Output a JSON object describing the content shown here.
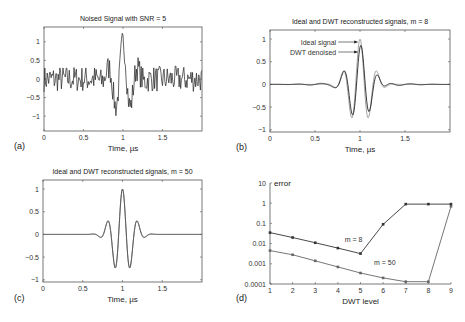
{
  "figure": {
    "panels": [
      "(a)",
      "(b)",
      "(c)",
      "(d)"
    ]
  },
  "chart_data": [
    {
      "id": "a",
      "panel_label": "(a)",
      "type": "line",
      "title": "Noised Signal with SNR = 5",
      "xlabel": "Time, µs",
      "ylabel": "",
      "xlim": [
        0,
        2
      ],
      "ylim": [
        -1.4,
        1.4
      ],
      "xticks": [
        0,
        0.5,
        1,
        1.5
      ],
      "xtick_labels": [
        "0",
        "0.5",
        "1",
        "1.5"
      ],
      "yticks": [
        1,
        0.5,
        0,
        -0.5,
        -1
      ],
      "ytick_labels": [
        "1",
        "0.5",
        "0",
        "−0.5",
        "−1"
      ],
      "series": [
        {
          "name": "noised signal",
          "kind": "noisy_wavelet",
          "center": 1.0,
          "amplitude": 1.0,
          "noise": 0.22,
          "color": "#222222"
        }
      ]
    },
    {
      "id": "b",
      "panel_label": "(b)",
      "type": "line",
      "title": "Ideal and DWT reconstructed signals, m = 8",
      "xlabel": "Time, µs",
      "ylabel": "",
      "xlim": [
        0,
        2
      ],
      "ylim": [
        -1.05,
        1.2
      ],
      "xticks": [
        0,
        0.5,
        1,
        1.5
      ],
      "xtick_labels": [
        "0",
        "0.5",
        "1",
        "1.5"
      ],
      "yticks": [
        1,
        0.5,
        0,
        -0.5,
        -1
      ],
      "ytick_labels": [
        "1",
        "0.5",
        "0",
        "−0.5",
        "−1"
      ],
      "series": [
        {
          "name": "Ideal signal",
          "kind": "wavelet",
          "center": 1.0,
          "amplitude": 1.0,
          "color": "#999999"
        },
        {
          "name": "DWT denoised",
          "kind": "wavelet_distorted",
          "center": 1.0,
          "amplitude": 0.85,
          "color": "#222222"
        }
      ],
      "annotations": [
        "Ideal signal",
        "DWT denoised"
      ]
    },
    {
      "id": "c",
      "panel_label": "(c)",
      "type": "line",
      "title": "Ideal and DWT reconstructed signals, m = 50",
      "xlabel": "Time, µs",
      "ylabel": "",
      "xlim": [
        0,
        2
      ],
      "ylim": [
        -1.05,
        1.2
      ],
      "xticks": [
        0,
        0.5,
        1,
        1.5
      ],
      "xtick_labels": [
        "0",
        "0.5",
        "1",
        "1.5"
      ],
      "yticks": [
        1,
        0.5,
        0,
        -0.5,
        -1
      ],
      "ytick_labels": [
        "1",
        "0.5",
        "0",
        "−0.5",
        "−1"
      ],
      "series": [
        {
          "name": "Ideal signal",
          "kind": "wavelet",
          "center": 1.0,
          "amplitude": 1.0,
          "color": "#888888"
        },
        {
          "name": "DWT denoised",
          "kind": "wavelet",
          "center": 1.0,
          "amplitude": 1.0,
          "color": "#555555"
        }
      ]
    },
    {
      "id": "d",
      "panel_label": "(d)",
      "type": "line",
      "title": "",
      "xlabel": "DWT level",
      "ylabel": "error",
      "yscale": "log",
      "xlim": [
        1,
        9
      ],
      "ylim": [
        0.0001,
        10
      ],
      "xticks": [
        1,
        2,
        3,
        4,
        5,
        6,
        7,
        8,
        9
      ],
      "xtick_labels": [
        "1",
        "2",
        "3",
        "4",
        "5",
        "6",
        "7",
        "8",
        "9"
      ],
      "yticks": [
        10,
        1,
        0.1,
        0.01,
        0.001,
        0.0001
      ],
      "ytick_labels": [
        "10",
        "1",
        "0.1",
        "0.01",
        "0.001",
        "0.0001"
      ],
      "x": [
        1,
        2,
        3,
        4,
        5,
        6,
        7,
        8,
        9
      ],
      "series": [
        {
          "name": "m = 8",
          "values": [
            0.035,
            0.02,
            0.011,
            0.006,
            0.0032,
            0.09,
            0.9,
            0.9,
            0.9
          ],
          "color": "#333333",
          "label_at": [
            4.3,
            0.012
          ]
        },
        {
          "name": "m = 50",
          "values": [
            0.0045,
            0.0028,
            0.0014,
            0.0007,
            0.00035,
            0.0002,
            0.00013,
            0.00013,
            0.7
          ],
          "color": "#666666",
          "label_at": [
            5.6,
            0.0009
          ]
        }
      ]
    }
  ]
}
